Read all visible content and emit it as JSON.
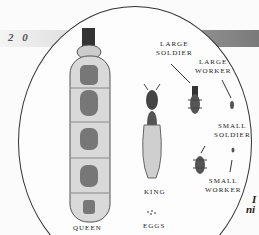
{
  "page": {
    "number": "2 0"
  },
  "illustration": {
    "title": "Termite castes",
    "labels": {
      "queen": "QUEEN",
      "king": "KING",
      "eggs": "EGGS",
      "large_soldier": [
        "LARGE",
        "SOLDIER"
      ],
      "large_worker": [
        "LARGE",
        "WORKER"
      ],
      "small_soldier": [
        "SMALL",
        "SOLDIER"
      ],
      "small_worker": [
        "SMALL",
        "WORKER"
      ]
    },
    "side_text": [
      "I",
      "ni"
    ]
  },
  "colors": {
    "band_dark": "#7a7a7a",
    "band_light": "#f4f4f4",
    "ink": "#222222"
  }
}
